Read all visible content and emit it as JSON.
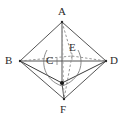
{
  "figure": {
    "background_color": "#ffffff",
    "stroke_color": "#555555",
    "dashed_stroke_color": "#8a8a8a",
    "point_color": "#1a1a1a",
    "label_color": "#2b2b2b"
  },
  "labels": {
    "a": "A",
    "b": "B",
    "c": "C",
    "d": "D",
    "e": "E",
    "f": "F"
  },
  "geometry": {
    "vertices": [
      {
        "name": "A",
        "x": 62,
        "y": 22
      },
      {
        "name": "B",
        "x": 20,
        "y": 61
      },
      {
        "name": "D",
        "x": 106,
        "y": 61
      },
      {
        "name": "F",
        "x": 64,
        "y": 99
      },
      {
        "name": "C",
        "x": 55,
        "y": 62
      },
      {
        "name": "E",
        "x": 72,
        "y": 56
      },
      {
        "name": "G",
        "x": 62,
        "y": 83
      }
    ],
    "solid_edges": [
      [
        "A",
        "B"
      ],
      [
        "A",
        "D"
      ],
      [
        "A",
        "G"
      ],
      [
        "B",
        "D"
      ],
      [
        "B",
        "G"
      ],
      [
        "D",
        "G"
      ],
      [
        "B",
        "F"
      ],
      [
        "D",
        "F"
      ],
      [
        "G",
        "F"
      ]
    ],
    "dashed_edges": [
      [
        "B",
        "E"
      ],
      [
        "E",
        "D"
      ],
      [
        "A",
        "E"
      ],
      [
        "E",
        "F"
      ],
      [
        "A",
        "C"
      ],
      [
        "C",
        "F"
      ]
    ],
    "arc": {
      "description": "elliptical arc through interior from B-side to D-side",
      "cx": 63,
      "cy": 61,
      "rx": 18,
      "ry": 22
    }
  }
}
